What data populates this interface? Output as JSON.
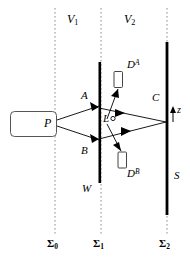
{
  "figure": {
    "colors": {
      "ink": "#000000",
      "dotted": "#8a8a8a",
      "background": "#ffffff"
    }
  },
  "labels": {
    "source": "P",
    "region_left": {
      "base": "V",
      "sub": "1"
    },
    "region_right": {
      "base": "V",
      "sub": "2"
    },
    "slit_upper": "A",
    "slit_lower": "B",
    "light_source": "L",
    "wall": "W",
    "screen": "S",
    "screen_point": "C",
    "axis": "z",
    "detector_upper": {
      "base": "D",
      "sup": "A"
    },
    "detector_lower": {
      "base": "D",
      "sup": "B"
    },
    "plane_0": {
      "base": "Σ",
      "sub": "0"
    },
    "plane_1": {
      "base": "Σ",
      "sub": "1"
    },
    "plane_2": {
      "base": "Σ",
      "sub": "2"
    }
  },
  "elements": {
    "source_box": "particle-source",
    "wall_bar": "barrier-wall",
    "screen_bar": "detection-screen",
    "detector_box_a": "detector-A-box",
    "detector_box_b": "detector-B-box",
    "marker_L": "light-source-marker",
    "rays": [
      "P-to-A",
      "P-to-B",
      "A-to-C",
      "B-to-C",
      "L-to-DA",
      "L-to-DB"
    ],
    "reference_planes": [
      "sigma-0",
      "sigma-1",
      "sigma-2"
    ]
  }
}
